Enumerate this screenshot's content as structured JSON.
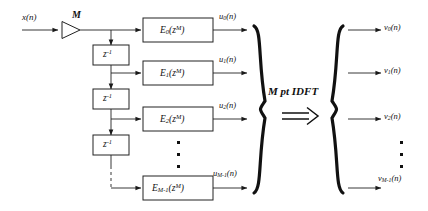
{
  "figure": {
    "type": "block-diagram",
    "background": "#ffffff",
    "line_color": "#222222"
  },
  "input": {
    "signal_label": "x(n)",
    "downsampler_label": "M",
    "downsampler_icon": "triangle-right-icon"
  },
  "delays": [
    {
      "label_base": "z",
      "label_exp": "-1"
    },
    {
      "label_base": "z",
      "label_exp": "-1"
    },
    {
      "label_base": "z",
      "label_exp": "-1"
    }
  ],
  "polyphase_blocks": [
    {
      "name": "E",
      "index": "0",
      "arg_base": "z",
      "arg_exp": "M",
      "out_name": "u",
      "out_index": "0",
      "out_arg": "(n)"
    },
    {
      "name": "E",
      "index": "1",
      "arg_base": "z",
      "arg_exp": "M",
      "out_name": "u",
      "out_index": "1",
      "out_arg": "(n)"
    },
    {
      "name": "E",
      "index": "2",
      "arg_base": "z",
      "arg_exp": "M",
      "out_name": "u",
      "out_index": "2",
      "out_arg": "(n)"
    },
    {
      "name": "E",
      "index": "M-1",
      "arg_base": "z",
      "arg_exp": "M",
      "out_name": "u",
      "out_index": "M-1",
      "out_arg": "(n)"
    }
  ],
  "transform": {
    "label": "M pt IDFT",
    "arrow_icon": "double-arrow-right-icon",
    "left_brace_icon": "right-curly-brace-icon",
    "right_brace_icon": "left-curly-brace-icon"
  },
  "outputs": [
    {
      "name": "v",
      "index": "0",
      "arg": "(n)"
    },
    {
      "name": "v",
      "index": "1",
      "arg": "(n)"
    },
    {
      "name": "v",
      "index": "2",
      "arg": "(n)"
    },
    {
      "name": "v",
      "index": "M-1",
      "arg": "(n)"
    }
  ],
  "ellipsis": {
    "glyph": "▪",
    "count": 3,
    "locations": [
      "polyphase-column",
      "output-column",
      "delay-column-dashed"
    ]
  }
}
